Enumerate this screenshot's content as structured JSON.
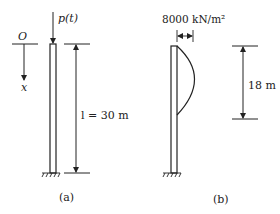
{
  "figure_a": {
    "caption": "(a)",
    "origin_label": "O",
    "axis_label": "x",
    "load_label": "p(t)",
    "length_label": "l = 30 m"
  },
  "figure_b": {
    "caption": "(b)",
    "load_magnitude_label": "8000 kN/m²",
    "distributed_length_label": "18 m"
  },
  "colors": {
    "line": "#222222",
    "background": "#ffffff"
  }
}
